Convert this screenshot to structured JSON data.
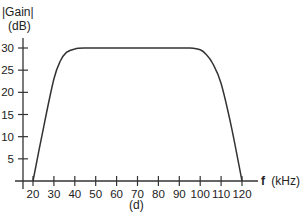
{
  "chart_data": {
    "type": "line",
    "title": "",
    "ylabel_line1": "|Gain|",
    "ylabel_line2": "(dB)",
    "xlabel_bold": "f",
    "xlabel_unit": "(kHz)",
    "caption": "(d)",
    "xlim": [
      15,
      135
    ],
    "ylim": [
      0,
      32
    ],
    "grid": false,
    "x_ticks": [
      20,
      30,
      40,
      50,
      60,
      70,
      80,
      90,
      100,
      110,
      120
    ],
    "y_ticks": [
      5,
      10,
      15,
      20,
      25,
      30
    ],
    "series": [
      {
        "name": "|Gain| (dB)",
        "color": "#333333",
        "x": [
          20,
          25,
          30,
          33,
          36,
          40,
          45,
          50,
          60,
          70,
          80,
          90,
          95,
          100,
          103,
          106,
          110,
          115,
          120
        ],
        "y": [
          0,
          12,
          23,
          27,
          29,
          29.8,
          30,
          30,
          30,
          30,
          30,
          30,
          30,
          29.6,
          28.5,
          26.5,
          22,
          12,
          0
        ]
      }
    ]
  }
}
